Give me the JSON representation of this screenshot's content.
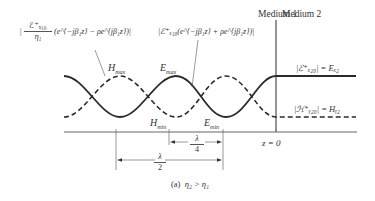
{
  "header": {
    "medium1": "Medium 1",
    "medium2": "Medium 2"
  },
  "formulas": {
    "h_incident_num": "ℰ⁺ₓ₁₀",
    "h_incident_den": "η₁",
    "h_incident_expr": "(e^{−jβ₁z} − ρe^{jβ₁z})|",
    "h_incident_open": "|",
    "e_incident": "|ℰ⁺ₓ₁₀(e^{−jβ₁z} + ρe^{jβ₁z})|",
    "e_transmitted": "|ℰ⁺ₓ₂₀| = Eₓ₂",
    "h_transmitted": "|ℋ⁺ᵧ₂₀| = Hᵧ₂"
  },
  "labels": {
    "h_max": "H",
    "h_max_sub": "max",
    "e_max": "E",
    "e_max_sub": "max",
    "h_min": "H",
    "h_min_sub": "min",
    "e_min": "E",
    "e_min_sub": "min",
    "z0": "z = 0",
    "lambda": "λ",
    "half_den": "2",
    "quarter_den": "4",
    "caption_prefix": "(a)",
    "caption_condition": "η₂ > η₁"
  },
  "colors": {
    "line": "#2a2a2a",
    "text": "#333333",
    "background": "#ffffff"
  },
  "curves": {
    "E_solid": "standing-wave |E| in medium 1, constant Ex2 in medium 2",
    "H_dashed": "standing-wave |H| in medium 1, constant Hy2 in medium 2"
  }
}
